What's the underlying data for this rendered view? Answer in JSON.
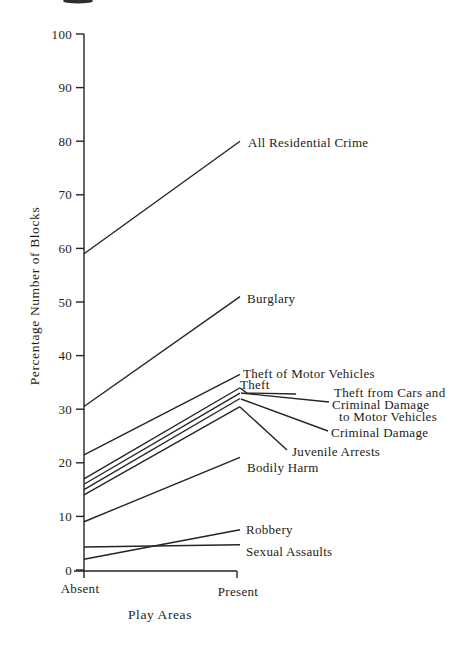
{
  "chart_data": {
    "type": "line",
    "variant": "slopegraph",
    "title": "",
    "xlabel": "Play Areas",
    "ylabel": "Percentage Number of Blocks",
    "categories": [
      "Absent",
      "Present"
    ],
    "ylim": [
      0,
      100
    ],
    "yticks": [
      0,
      10,
      20,
      30,
      40,
      50,
      60,
      70,
      80,
      90,
      100
    ],
    "grid": false,
    "legend": "inline-labels-right",
    "line_color": "#242424",
    "background": "#ffffff",
    "series": [
      {
        "name": "All Residential Crime",
        "values": [
          59,
          80
        ],
        "label": {
          "lines": [
            {
              "text": "All Residential Crime",
              "x": 248,
              "y": 147
            }
          ]
        }
      },
      {
        "name": "Burglary",
        "values": [
          30.5,
          51
        ],
        "label": {
          "lines": [
            {
              "text": "Burglary",
              "x": 247,
              "y": 303
            }
          ]
        }
      },
      {
        "name": "Theft of Motor Vehicles",
        "values": [
          21.5,
          36.5
        ],
        "label": {
          "lines": [
            {
              "text": "Theft of Motor Vehicles",
              "x": 243,
              "y": 378
            }
          ]
        }
      },
      {
        "name": "Theft",
        "values": [
          17,
          34
        ],
        "label": {
          "lines": [
            {
              "text": "Theft",
              "x": 240,
              "y": 389
            }
          ],
          "leader": [
            [
              240,
              388
            ],
            [
              247,
              393
            ],
            [
              296,
              394
            ]
          ]
        }
      },
      {
        "name": "Theft from Cars and Criminal Damage to Motor Vehicles",
        "values": [
          16,
          33
        ],
        "label": {
          "lines": [
            {
              "text": "Theft from Cars and",
              "x": 334,
              "y": 397
            },
            {
              "text": "Criminal Damage",
              "x": 332,
              "y": 409
            },
            {
              "text": "to Motor Vehicles",
              "x": 339,
              "y": 421
            }
          ],
          "leader": [
            [
              241,
              393
            ],
            [
              329,
              402
            ]
          ]
        }
      },
      {
        "name": "Criminal Damage",
        "values": [
          15,
          32
        ],
        "label": {
          "lines": [
            {
              "text": "Criminal Damage",
              "x": 331,
              "y": 437
            }
          ],
          "leader": [
            [
              241,
              399
            ],
            [
              328,
              431
            ]
          ]
        }
      },
      {
        "name": "Juvenile Arrests",
        "values": [
          14,
          30.5
        ],
        "label": {
          "lines": [
            {
              "text": "Juvenile Arrests",
              "x": 292,
              "y": 456
            }
          ],
          "leader": [
            [
              240,
              407
            ],
            [
              287,
              450
            ]
          ]
        }
      },
      {
        "name": "Bodily Harm",
        "values": [
          9,
          21
        ],
        "label": {
          "lines": [
            {
              "text": "Bodily Harm",
              "x": 247,
              "y": 472
            }
          ]
        }
      },
      {
        "name": "Robbery",
        "values": [
          2,
          7.5
        ],
        "label": {
          "lines": [
            {
              "text": "Robbery",
              "x": 246,
              "y": 534
            }
          ]
        }
      },
      {
        "name": "Sexual Assaults",
        "values": [
          4.3,
          4.7
        ],
        "label": {
          "lines": [
            {
              "text": "Sexual Assaults",
              "x": 246,
              "y": 556
            }
          ]
        }
      }
    ]
  }
}
